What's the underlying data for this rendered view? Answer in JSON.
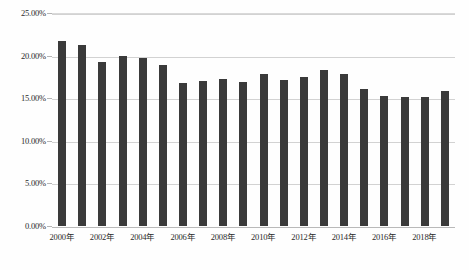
{
  "chart_data": {
    "type": "bar",
    "title": "",
    "subtitle": "",
    "xlabel": "",
    "ylabel": "",
    "categories": [
      "2000年",
      "2001年",
      "2002年",
      "2003年",
      "2004年",
      "2005年",
      "2006年",
      "2007年",
      "2008年",
      "2009年",
      "2010年",
      "2011年",
      "2012年",
      "2013年",
      "2014年",
      "2015年",
      "2016年",
      "2017年",
      "2018年",
      "2019年"
    ],
    "values": [
      21.7,
      21.2,
      19.3,
      20.0,
      19.7,
      18.9,
      16.8,
      17.0,
      17.2,
      16.9,
      17.8,
      17.1,
      17.5,
      18.3,
      17.9,
      16.1,
      15.3,
      15.1,
      15.1,
      15.9
    ],
    "value_labels": [
      "21.70%",
      "21.20%",
      "19.30%",
      "20.00%",
      "19.70%",
      "18.90%",
      "16.80%",
      "17.00%",
      "17.20%",
      "16.90%",
      "17.80%",
      "17.10%",
      "17.50%",
      "18.30%",
      "17.90%",
      "16.10%",
      "15.30%",
      "15.10%",
      "15.10%",
      "15.90%"
    ],
    "visible_x_tick_labels": [
      "2000年",
      "2002年",
      "2004年",
      "2006年",
      "2008年",
      "2010年",
      "2012年",
      "2014年",
      "2016年",
      "2018年"
    ],
    "visible_x_tick_indices": [
      0,
      2,
      4,
      6,
      8,
      10,
      12,
      14,
      16,
      18
    ],
    "y_tick_labels": [
      "0.00%",
      "5.00%",
      "10.00%",
      "15.00%",
      "20.00%",
      "25.00%"
    ],
    "y_tick_values": [
      0,
      5,
      10,
      15,
      20,
      25
    ],
    "ylim": [
      0,
      25
    ],
    "grid": true,
    "legend": false,
    "legend_position": "none",
    "colors": {
      "bar": "#3a3a3a",
      "gridline": "#d2d2d2",
      "axis_text": "#2b2b2b",
      "background": "#fefefe"
    }
  }
}
